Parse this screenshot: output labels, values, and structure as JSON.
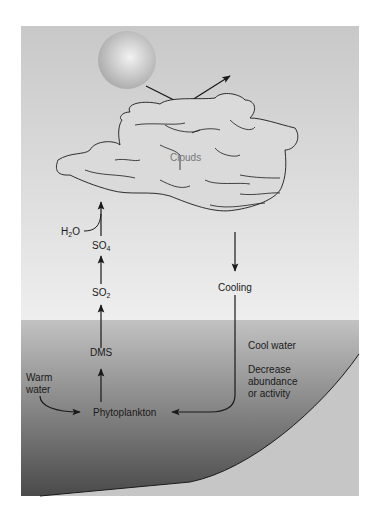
{
  "diagram": {
    "title": "",
    "colors": {
      "sky_top": "#c9c9c9",
      "sky_bottom": "#ececec",
      "sea_top": "#bdbdbd",
      "sea_bottom": "#4a4a4a",
      "seafloor": "#c4c4c4",
      "sun": "#b5b5b5",
      "cloud_fill": "#d8d8d8",
      "line": "#1a1a1a"
    },
    "labels": {
      "clouds": "Clouds",
      "h2o_main": "H",
      "h2o_sub": "2",
      "h2o_tail": "O",
      "so4_main": "SO",
      "so4_sub": "4",
      "so2_main": "SO",
      "so2_sub": "2",
      "dms": "DMS",
      "cooling": "Cooling",
      "warm_water_line1": "Warm",
      "warm_water_line2": "water",
      "phytoplankton": "Phytoplankton",
      "cool_water": "Cool water",
      "decrease_line1": "Decrease",
      "decrease_line2": "abundance",
      "decrease_line3": "or activity"
    },
    "flows": [
      {
        "from": "Warm water",
        "to": "Phytoplankton"
      },
      {
        "from": "Phytoplankton",
        "to": "DMS"
      },
      {
        "from": "DMS",
        "to": "SO2"
      },
      {
        "from": "SO2",
        "to": "SO4"
      },
      {
        "from": "SO4",
        "to": "Clouds",
        "with": "H2O"
      },
      {
        "from": "Clouds",
        "to": "Cooling"
      },
      {
        "from": "Cooling",
        "to": "Phytoplankton",
        "effect": "Cool water; Decrease abundance or activity"
      },
      {
        "from": "Sun",
        "to": "Clouds",
        "effect": "reflected radiation"
      }
    ]
  }
}
